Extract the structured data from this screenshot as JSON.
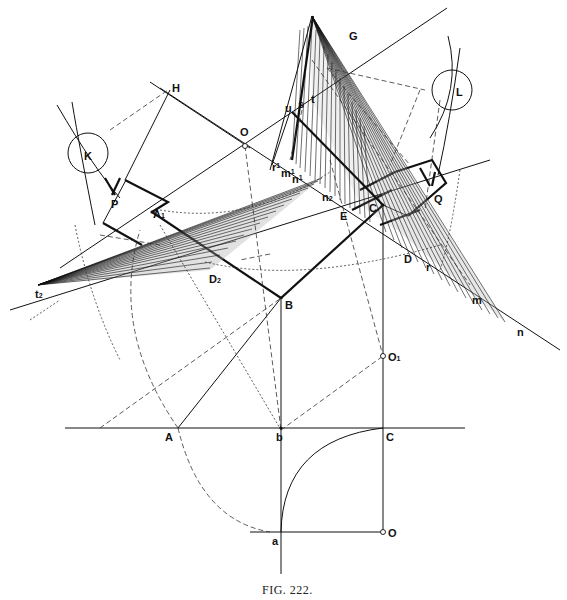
{
  "figure": {
    "caption": "Fig. 222.",
    "caption_display": "FIG.  222."
  },
  "labels": {
    "H": "H",
    "O_top": "O",
    "G": "G",
    "s": "s",
    "t": "t",
    "u": "u",
    "L": "L",
    "K": "K",
    "P": "P",
    "A1": "A",
    "A1_sub": "1",
    "r1": "r",
    "r1_sub": "1",
    "m1": "m",
    "m1_sub": "1",
    "n1": "n",
    "n1_sub": "1",
    "n2": "n",
    "n2_sub": "2",
    "E": "E",
    "C_upper": "C",
    "Q": "Q",
    "D": "D",
    "r": "r",
    "m": "m",
    "n": "n",
    "t2": "t",
    "t2_sub": "2",
    "D2": "D",
    "D2_sub": "2",
    "B": "B",
    "O1": "O",
    "O1_sub": "1",
    "A": "A",
    "b": "b",
    "C_lower": "C",
    "a": "a",
    "O_bottom": "O"
  },
  "colors": {
    "ink": "#111111",
    "paper": "#ffffff"
  }
}
